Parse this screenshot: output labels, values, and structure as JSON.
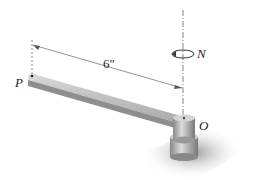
{
  "diagram": {
    "labels": {
      "point_p": "P",
      "point_o": "O",
      "torque": "N",
      "dimension": "6″"
    },
    "colors": {
      "bar_top": "#c8c8c8",
      "bar_side": "#8e8e8e",
      "cylinder": "#bdbdbd",
      "shadow": "#9a9a9a",
      "line": "#555555"
    }
  }
}
